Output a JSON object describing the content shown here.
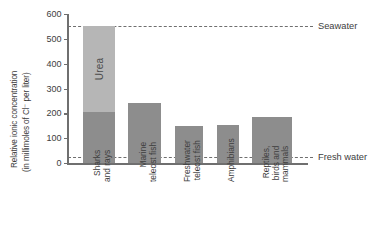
{
  "chart_data": {
    "type": "bar",
    "title": "",
    "xlabel": "",
    "ylabel_line1": "Relative ionic concentration",
    "ylabel_line2": "(in millimoles of Cl⁻ per liter)",
    "ylim": [
      0,
      600
    ],
    "yticks": [
      0,
      100,
      200,
      300,
      400,
      500,
      600
    ],
    "ytick_labels": [
      "0",
      "100",
      "200",
      "300",
      "400",
      "500",
      "600"
    ],
    "grid": false,
    "legend": "none",
    "categories": [
      "Sharks and rays",
      "Marine teleost fish",
      "Freshwater teleost fish",
      "Amphibians",
      "Reptiles, birds and mammals"
    ],
    "category_label_lines": [
      [
        "Sharks",
        "and rays"
      ],
      [
        "Marine",
        "teleost fish"
      ],
      [
        "Freshwater",
        "teleost fish"
      ],
      [
        "Amphibians"
      ],
      [
        "Reptiles,",
        "birds and",
        "mammals"
      ]
    ],
    "series": [
      {
        "name": "Ionic concentration",
        "color": "#8d8d8d",
        "values": [
          205,
          240,
          150,
          155,
          185
        ]
      },
      {
        "name": "Urea",
        "color": "#b6b6b6",
        "values": [
          345,
          0,
          0,
          0,
          0
        ]
      }
    ],
    "totals": [
      550,
      240,
      150,
      155,
      185
    ],
    "segment_labels": [
      "Urea",
      "",
      "",
      "",
      ""
    ],
    "reference_lines": [
      {
        "label": "Seawater",
        "value": 550,
        "style": "dashed"
      },
      {
        "label": "Fresh water",
        "value": 25,
        "style": "dashed"
      }
    ],
    "axis_color": "#6f6f6f",
    "text_color": "#3d3d3d",
    "background": "#ffffff"
  }
}
